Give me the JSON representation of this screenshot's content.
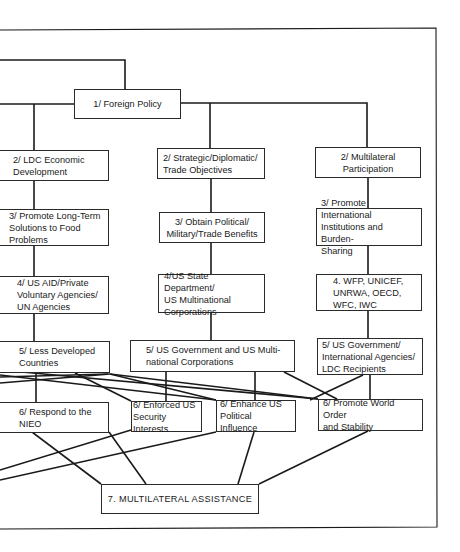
{
  "diagram": {
    "type": "hierarchy-flowchart",
    "nodes": {
      "foreign_policy": "1/ Foreign Policy",
      "ldc_econ": "2/ LDC Economic\nDevelopment",
      "strategic": "2/ Strategic/Diplomatic/\nTrade Objectives",
      "multilateral": "2/ Multilateral\nParticipation",
      "food": "3/ Promote Long-Term\nSolutions to Food\nProblems",
      "obtain": "3/ Obtain Political/\nMilitary/Trade Benefits",
      "intl_inst": "3/ Promote International\nInstitutions and Burden-\nSharing",
      "usaid": "4/ US AID/Private\nVoluntary Agencies/\nUN Agencies",
      "state_dept": "4/US State Department/\nUS Multinational\nCorporations",
      "wfp": "4. WFP, UNICEF,\nUNRWA, OECD,\nWFC, IWC",
      "ldc_countries": "5/ Less Developed\nCountries",
      "us_gov": "5/ US Government and US Multi-\nnational Corporations",
      "recipients": "5/ US Government/\nInternational Agencies/\nLDC Recipients",
      "nieo": "6/ Respond to the\nNIEO",
      "security": "6/ Enforced US\nSecurity Interests",
      "political": "6/ Enhance US\nPolitical Influence",
      "world_order": "6/ Promote World Order\nand Stability",
      "assistance": "7. MULTILATERAL ASSISTANCE"
    },
    "colors": {
      "line": "#1a1a1a",
      "background": "#ffffff"
    }
  }
}
